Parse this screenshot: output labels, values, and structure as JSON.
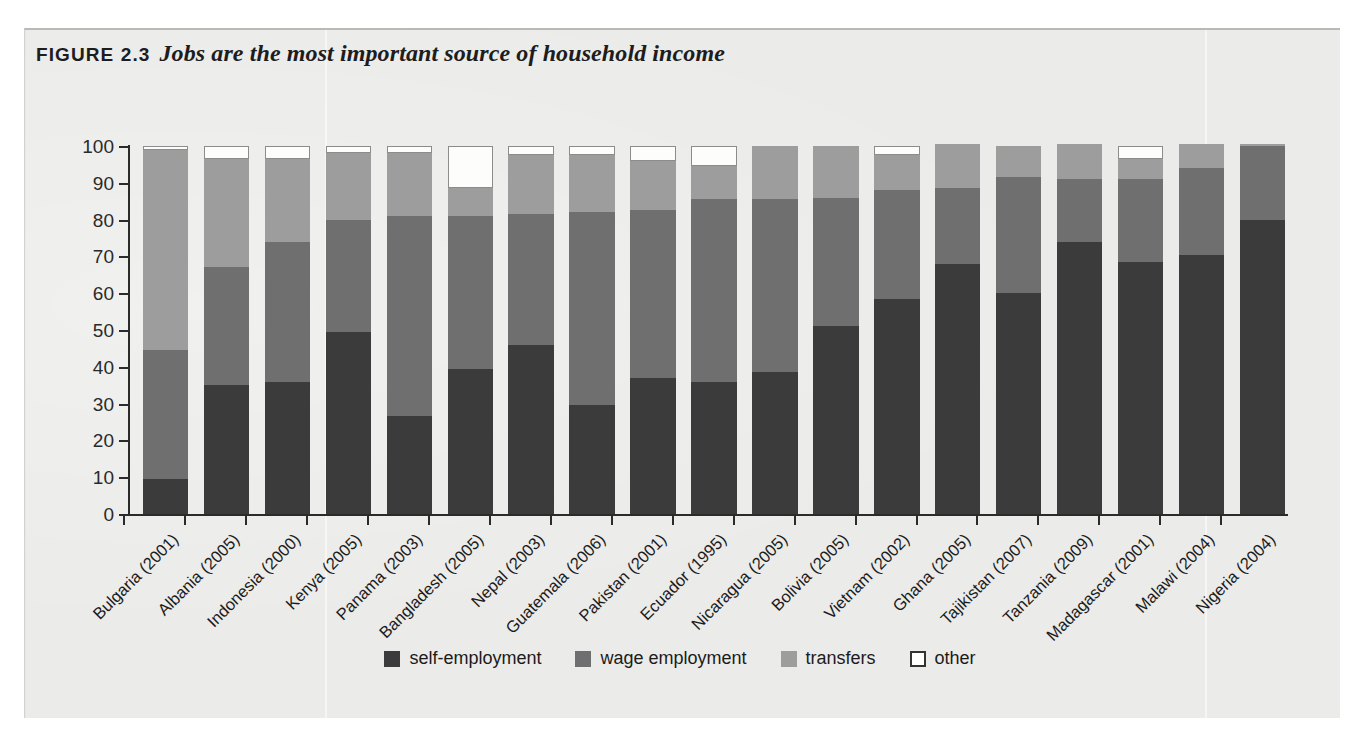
{
  "figure": {
    "number_label": "FIGURE 2.3",
    "title": "Jobs are the most important source of household income"
  },
  "axes": {
    "y_label": "percentage of household income",
    "y_ticks": [
      "0",
      "10",
      "20",
      "30",
      "40",
      "50",
      "60",
      "70",
      "80",
      "90",
      "100"
    ]
  },
  "legend": {
    "items": [
      {
        "label": "self-employment",
        "key": "self",
        "color": "#3b3b3b",
        "icon": "square-swatch-icon"
      },
      {
        "label": "wage employment",
        "key": "wage",
        "color": "#6f6f6f",
        "icon": "square-swatch-icon"
      },
      {
        "label": "transfers",
        "key": "transfers",
        "color": "#9d9d9d",
        "icon": "square-swatch-icon"
      },
      {
        "label": "other",
        "key": "other",
        "color": "#ffffff",
        "icon": "square-outline-swatch-icon"
      }
    ]
  },
  "chart_data": {
    "type": "bar",
    "subtype": "stacked-vertical-100pct",
    "title": "Jobs are the most important source of household income",
    "xlabel": "",
    "ylabel": "percentage of household income",
    "ylim": [
      0,
      100
    ],
    "yticks": [
      0,
      10,
      20,
      30,
      40,
      50,
      60,
      70,
      80,
      90,
      100
    ],
    "grid": false,
    "legend_position": "bottom-center",
    "categories": [
      "Bulgaria (2001)",
      "Albania (2005)",
      "Indonesia (2000)",
      "Kenya (2005)",
      "Panama (2003)",
      "Bangladesh (2005)",
      "Nepal (2003)",
      "Guatemala (2006)",
      "Pakistan (2001)",
      "Ecuador (1995)",
      "Nicaragua (2005)",
      "Bolivia (2005)",
      "Vietnam (2002)",
      "Ghana (2005)",
      "Tajikistan (2007)",
      "Tanzania (2009)",
      "Madagascar (2001)",
      "Malawi (2004)",
      "Nigeria (2004)"
    ],
    "series": [
      {
        "name": "self-employment",
        "color": "#3b3b3b",
        "values": [
          9.5,
          35.0,
          36.0,
          49.5,
          26.5,
          39.5,
          46.0,
          29.5,
          37.0,
          36.0,
          38.5,
          51.0,
          58.5,
          68.0,
          60.0,
          74.0,
          68.5,
          70.5,
          80.0
        ]
      },
      {
        "name": "wage employment",
        "color": "#6f6f6f",
        "values": [
          35.0,
          32.0,
          38.0,
          30.5,
          54.5,
          41.5,
          35.5,
          52.5,
          45.5,
          49.5,
          47.0,
          35.0,
          29.5,
          20.5,
          31.5,
          17.0,
          22.5,
          23.5,
          20.0
        ]
      },
      {
        "name": "transfers",
        "color": "#9d9d9d",
        "values": [
          54.5,
          29.5,
          22.5,
          18.0,
          17.0,
          7.5,
          16.0,
          15.5,
          13.5,
          9.0,
          14.5,
          14.0,
          9.5,
          12.0,
          8.5,
          9.5,
          5.5,
          6.5,
          0.5
        ]
      },
      {
        "name": "other",
        "color": "#ffffff",
        "values": [
          1.0,
          3.5,
          3.5,
          2.0,
          2.0,
          11.5,
          2.5,
          2.5,
          4.0,
          5.5,
          0.0,
          0.0,
          2.5,
          0.0,
          0.0,
          0.0,
          3.5,
          0.0,
          0.0
        ]
      }
    ]
  }
}
